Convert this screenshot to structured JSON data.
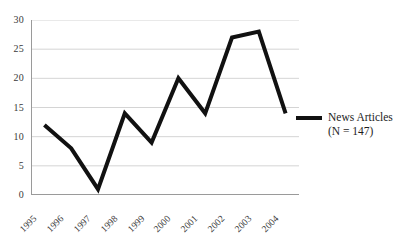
{
  "chart_data": {
    "type": "line",
    "title": "",
    "xlabel": "",
    "ylabel": "",
    "categories": [
      "1995",
      "1996",
      "1997",
      "1998",
      "1999",
      "2000",
      "2001",
      "2002",
      "2003",
      "2004"
    ],
    "values": [
      12,
      8,
      1,
      14,
      9,
      20,
      14,
      27,
      28,
      14
    ],
    "series": [
      {
        "name": "News Articles",
        "values": [
          12,
          8,
          1,
          14,
          9,
          20,
          14,
          27,
          28,
          14
        ],
        "color": "#111111"
      }
    ],
    "ylim": [
      0,
      30
    ],
    "yticks": [
      0,
      5,
      10,
      15,
      20,
      25,
      30
    ],
    "ytick_labels": [
      "0",
      "5",
      "10",
      "15",
      "20",
      "25",
      "30"
    ],
    "grid": "horizontal",
    "grid_color": "#c9c9c9",
    "axis_color": "#9a9a9a",
    "legend_position": "right",
    "legend": [
      {
        "label_line1": "News Articles",
        "label_line2": "(N = 147)",
        "color": "#111111"
      }
    ]
  }
}
